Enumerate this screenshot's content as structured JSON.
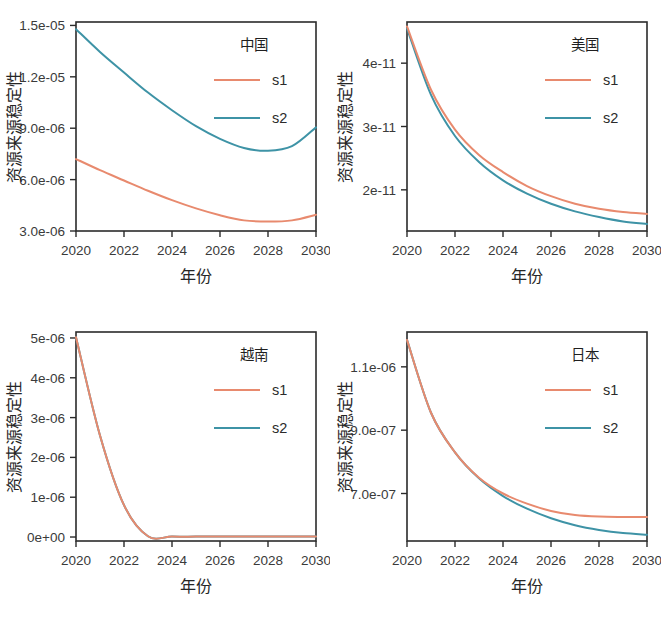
{
  "figure": {
    "panel_count": 4,
    "shared_xlabel": "年份",
    "shared_ylabel": "资源来源稳定性",
    "series_names": [
      "s1",
      "s2"
    ],
    "colors": {
      "s1": "#E88A6E",
      "s2": "#3E93A6",
      "axis": "#2b2b2b",
      "background": "#ffffff"
    }
  },
  "chart_data": [
    {
      "type": "line",
      "title": "中国",
      "legend_title": "中国",
      "legend_position": "top-right-inside",
      "xlabel": "年份",
      "ylabel": "资源来源稳定性",
      "grid": false,
      "x": [
        2020,
        2021,
        2022,
        2023,
        2024,
        2025,
        2026,
        2027,
        2028,
        2029,
        2030
      ],
      "xlim": [
        2020,
        2030
      ],
      "xticks": [
        2020,
        2022,
        2024,
        2026,
        2028,
        2030
      ],
      "xticklabels": [
        "2020",
        "2022",
        "2024",
        "2026",
        "2028",
        "2030"
      ],
      "ylim": [
        3e-06,
        1.52e-05
      ],
      "yticks": [
        3e-06,
        6e-06,
        9e-06,
        1.2e-05,
        1.5e-05
      ],
      "yticklabels": [
        "3.0e-06",
        "6.0e-06",
        "9.0e-06",
        "1.2e-05",
        "1.5e-05"
      ],
      "series": [
        {
          "name": "s1",
          "color": "#E88A6E",
          "values": [
            7.2e-06,
            6.55e-06,
            5.95e-06,
            5.35e-06,
            4.8e-06,
            4.32e-06,
            3.92e-06,
            3.62e-06,
            3.55e-06,
            3.62e-06,
            3.95e-06
          ]
        },
        {
          "name": "s2",
          "color": "#3E93A6",
          "values": [
            1.478e-05,
            1.345e-05,
            1.225e-05,
            1.108e-05,
            1.005e-05,
            9.12e-06,
            8.38e-06,
            7.85e-06,
            7.68e-06,
            7.95e-06,
            9.05e-06
          ]
        }
      ]
    },
    {
      "type": "line",
      "title": "美国",
      "legend_title": "美国",
      "legend_position": "top-right-inside",
      "xlabel": "年份",
      "ylabel": "资源来源稳定性",
      "grid": false,
      "x": [
        2020,
        2021,
        2022,
        2023,
        2024,
        2025,
        2026,
        2027,
        2028,
        2029,
        2030
      ],
      "xlim": [
        2020,
        2030
      ],
      "xticks": [
        2020,
        2022,
        2024,
        2026,
        2028,
        2030
      ],
      "xticklabels": [
        "2020",
        "2022",
        "2024",
        "2026",
        "2028",
        "2030"
      ],
      "ylim": [
        1.35e-11,
        4.65e-11
      ],
      "yticks": [
        2e-11,
        3e-11,
        4e-11
      ],
      "yticklabels": [
        "2e-11",
        "3e-11",
        "4e-11"
      ],
      "series": [
        {
          "name": "s1",
          "color": "#E88A6E",
          "values": [
            4.58e-11,
            3.58e-11,
            2.95e-11,
            2.55e-11,
            2.28e-11,
            2.06e-11,
            1.9e-11,
            1.78e-11,
            1.7e-11,
            1.65e-11,
            1.62e-11
          ]
        },
        {
          "name": "s2",
          "color": "#3E93A6",
          "values": [
            4.55e-11,
            3.5e-11,
            2.85e-11,
            2.44e-11,
            2.15e-11,
            1.94e-11,
            1.78e-11,
            1.66e-11,
            1.57e-11,
            1.5e-11,
            1.46e-11
          ]
        }
      ]
    },
    {
      "type": "line",
      "title": "越南",
      "legend_title": "越南",
      "legend_position": "top-right-inside",
      "xlabel": "年份",
      "ylabel": "资源来源稳定性",
      "grid": false,
      "x": [
        2020,
        2021,
        2022,
        2023,
        2024,
        2025,
        2026,
        2027,
        2028,
        2029,
        2030
      ],
      "xlim": [
        2020,
        2030
      ],
      "xticks": [
        2020,
        2022,
        2024,
        2026,
        2028,
        2030
      ],
      "xticklabels": [
        "2020",
        "2022",
        "2024",
        "2026",
        "2028",
        "2030"
      ],
      "ylim": [
        -1e-07,
        5.15e-06
      ],
      "yticks": [
        0,
        1e-06,
        2e-06,
        3e-06,
        4e-06,
        5e-06
      ],
      "yticklabels": [
        "0e+00",
        "1e-06",
        "2e-06",
        "3e-06",
        "4e-06",
        "5e-06"
      ],
      "series": [
        {
          "name": "s1",
          "color": "#E88A6E",
          "values": [
            5.02e-06,
            2.55e-06,
            8e-07,
            2e-08,
            1e-08,
            1e-08,
            1e-08,
            1e-08,
            1e-08,
            1e-08,
            1e-08
          ]
        },
        {
          "name": "s2",
          "color": "#3E93A6",
          "values": [
            5.02e-06,
            2.55e-06,
            8e-07,
            2e-08,
            1e-08,
            1e-08,
            1e-08,
            1e-08,
            1e-08,
            1e-08,
            1e-08
          ]
        }
      ]
    },
    {
      "type": "line",
      "title": "日本",
      "legend_title": "日本",
      "legend_position": "top-right-inside",
      "xlabel": "年份",
      "ylabel": "资源来源稳定性",
      "grid": false,
      "x": [
        2020,
        2021,
        2022,
        2023,
        2024,
        2025,
        2026,
        2027,
        2028,
        2029,
        2030
      ],
      "xlim": [
        2020,
        2030
      ],
      "xticks": [
        2020,
        2022,
        2024,
        2026,
        2028,
        2030
      ],
      "xticklabels": [
        "2020",
        "2022",
        "2024",
        "2026",
        "2028",
        "2030"
      ],
      "ylim": [
        5.5e-07,
        1.21e-06
      ],
      "yticks": [
        7e-07,
        9e-07,
        1.1e-06
      ],
      "yticklabels": [
        "7.0e-07",
        "9.0e-07",
        "1.1e-06"
      ],
      "series": [
        {
          "name": "s1",
          "color": "#E88A6E",
          "values": [
            1.185e-06,
            9.55e-07,
            8.3e-07,
            7.5e-07,
            7e-07,
            6.68e-07,
            6.45e-07,
            6.32e-07,
            6.27e-07,
            6.26e-07,
            6.26e-07
          ]
        },
        {
          "name": "s2",
          "color": "#3E93A6",
          "values": [
            1.185e-06,
            9.55e-07,
            8.3e-07,
            7.48e-07,
            6.92e-07,
            6.52e-07,
            6.22e-07,
            6e-07,
            5.85e-07,
            5.75e-07,
            5.7e-07
          ]
        }
      ]
    }
  ]
}
